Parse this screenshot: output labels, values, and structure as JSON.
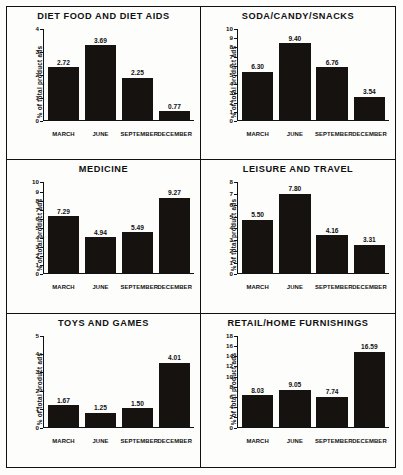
{
  "figure": {
    "ylabel": "% of total product ads",
    "categories": [
      "MARCH",
      "JUNE",
      "SEPTEMBER",
      "DECEMBER"
    ],
    "bar_color": "#16120f"
  },
  "chart_data": [
    {
      "type": "bar",
      "title": "DIET FOOD AND DIET AIDS",
      "categories": [
        "MARCH",
        "JUNE",
        "SEPTEMBER",
        "DECEMBER"
      ],
      "values": [
        2.72,
        3.69,
        2.25,
        0.77
      ],
      "labels": [
        "2.72",
        "3.69",
        "2.25",
        "0.77"
      ],
      "xlabel": "",
      "ylabel": "% of total product ads",
      "ylim": [
        0,
        4
      ],
      "yticks": [
        0,
        1,
        2,
        3,
        4
      ],
      "ytick_labels": [
        "0",
        "1",
        "2",
        "3",
        "4"
      ],
      "grid": false,
      "legend": "none"
    },
    {
      "type": "bar",
      "title": "SODA/CANDY/SNACKS",
      "categories": [
        "MARCH",
        "JUNE",
        "SEPTEMBER",
        "DECEMBER"
      ],
      "values": [
        6.3,
        9.4,
        6.76,
        3.54
      ],
      "labels": [
        "6.30",
        "9.40",
        "6.76",
        "3.54"
      ],
      "xlabel": "",
      "ylabel": "% of total product ads",
      "ylim": [
        0,
        10
      ],
      "yticks": [
        0,
        1,
        2,
        3,
        4,
        5,
        6,
        7,
        8,
        9,
        10
      ],
      "ytick_labels": [
        "0",
        "1",
        "2",
        "3",
        "4",
        "5",
        "6",
        "7",
        "8",
        "9",
        "10"
      ],
      "grid": false,
      "legend": "none"
    },
    {
      "type": "bar",
      "title": "MEDICINE",
      "categories": [
        "MARCH",
        "JUNE",
        "SEPTEMBER",
        "DECEMBER"
      ],
      "values": [
        7.29,
        4.94,
        5.49,
        9.27
      ],
      "labels": [
        "7.29",
        "4.94",
        "5.49",
        "9.27"
      ],
      "xlabel": "",
      "ylabel": "% of total product ads",
      "ylim": [
        0,
        10
      ],
      "yticks": [
        0,
        1,
        2,
        3,
        4,
        5,
        6,
        7,
        8,
        9,
        10
      ],
      "ytick_labels": [
        "0",
        "1",
        "2",
        "3",
        "4",
        "5",
        "6",
        "7",
        "8",
        "9",
        "10"
      ],
      "grid": false,
      "legend": "none"
    },
    {
      "type": "bar",
      "title": "LEISURE AND TRAVEL",
      "categories": [
        "MARCH",
        "JUNE",
        "SEPTEMBER",
        "DECEMBER"
      ],
      "values": [
        5.5,
        7.8,
        4.16,
        3.31
      ],
      "labels": [
        "5.50",
        "7.80",
        "4.16",
        "3.31"
      ],
      "xlabel": "",
      "ylabel": "% of total product ads",
      "ylim": [
        0,
        8
      ],
      "yticks": [
        0,
        1,
        2,
        3,
        4,
        5,
        6,
        7,
        8
      ],
      "ytick_labels": [
        "0",
        "1",
        "2",
        "3",
        "4",
        "5",
        "6",
        "7",
        "8"
      ],
      "grid": false,
      "legend": "none"
    },
    {
      "type": "bar",
      "title": "TOYS AND GAMES",
      "categories": [
        "MARCH",
        "JUNE",
        "SEPTEMBER",
        "DECEMBER"
      ],
      "values": [
        1.67,
        1.25,
        1.5,
        4.01
      ],
      "labels": [
        "1.67",
        "1.25",
        "1.50",
        "4.01"
      ],
      "xlabel": "",
      "ylabel": "% of total product ads",
      "ylim": [
        0,
        5
      ],
      "yticks": [
        0,
        1,
        2,
        3,
        4,
        5
      ],
      "ytick_labels": [
        "0",
        "1",
        "2",
        "3",
        "4",
        "5"
      ],
      "grid": false,
      "legend": "none"
    },
    {
      "type": "bar",
      "title": "RETAIL/HOME FURNISHINGS",
      "categories": [
        "MARCH",
        "JUNE",
        "SEPTEMBER",
        "DECEMBER"
      ],
      "values": [
        8.03,
        9.05,
        7.74,
        16.59
      ],
      "labels": [
        "8.03",
        "9.05",
        "7.74",
        "16.59"
      ],
      "xlabel": "",
      "ylabel": "% of total product ads",
      "ylim": [
        0,
        18
      ],
      "yticks": [
        0,
        2,
        4,
        6,
        8,
        10,
        12,
        14,
        16,
        18
      ],
      "ytick_labels": [
        "0",
        "2",
        "4",
        "6",
        "8",
        "10",
        "12",
        "14",
        "16",
        "18"
      ],
      "grid": false,
      "legend": "none"
    }
  ]
}
